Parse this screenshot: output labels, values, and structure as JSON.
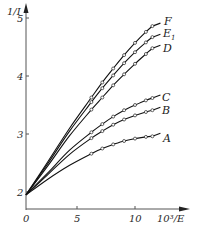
{
  "chart_data": {
    "type": "line",
    "title": "",
    "xlabel": "10³/E",
    "ylabel": "1/I",
    "xlim": [
      0,
      13.5
    ],
    "ylim": [
      1.73,
      5.2
    ],
    "x_ticks": [
      "0",
      "5",
      "10"
    ],
    "y_ticks": [
      "2",
      "3",
      "4",
      "5"
    ],
    "grid": false,
    "legend_position": "inline labels at right end of each curve",
    "series": [
      {
        "name": "A",
        "x": [
          0,
          2,
          4,
          6,
          7,
          8,
          9,
          10,
          11,
          11.6
        ],
        "values": [
          1.95,
          2.22,
          2.46,
          2.66,
          2.75,
          2.82,
          2.88,
          2.92,
          2.95,
          2.96
        ]
      },
      {
        "name": "B",
        "x": [
          0,
          2,
          4,
          6,
          7,
          8,
          9,
          10,
          11,
          11.6
        ],
        "values": [
          1.95,
          2.3,
          2.65,
          2.93,
          3.05,
          3.16,
          3.25,
          3.32,
          3.38,
          3.41
        ]
      },
      {
        "name": "C",
        "x": [
          0,
          2,
          4,
          6,
          7,
          8,
          9,
          10,
          11,
          11.6
        ],
        "values": [
          1.95,
          2.33,
          2.72,
          3.03,
          3.17,
          3.3,
          3.41,
          3.5,
          3.58,
          3.62
        ]
      },
      {
        "name": "D",
        "x": [
          0,
          2,
          4,
          6,
          7,
          8,
          9,
          10,
          11,
          11.6
        ],
        "values": [
          1.95,
          2.45,
          2.97,
          3.42,
          3.63,
          3.84,
          4.03,
          4.21,
          4.38,
          4.48
        ]
      },
      {
        "name": "E1",
        "x": [
          0,
          2,
          4,
          6,
          7,
          8,
          9,
          10,
          11,
          11.6
        ],
        "values": [
          1.95,
          2.49,
          3.05,
          3.55,
          3.79,
          4.01,
          4.22,
          4.41,
          4.58,
          4.67
        ]
      },
      {
        "name": "F",
        "x": [
          0,
          2,
          4,
          6,
          7,
          8,
          9,
          10,
          11,
          11.6
        ],
        "values": [
          1.95,
          2.52,
          3.1,
          3.63,
          3.89,
          4.13,
          4.36,
          4.57,
          4.76,
          4.86
        ]
      }
    ],
    "markers": "open circles on data points from x≈6.5 to x≈11.5"
  },
  "axes": {
    "y_label": "1/I",
    "x_label": "10³/E",
    "y_tick_labels": [
      "2",
      "3",
      "4",
      "5"
    ],
    "x_tick_labels": [
      "0",
      "5",
      "10"
    ]
  },
  "curve_labels": {
    "A": "A",
    "B": "B",
    "C": "C",
    "D": "D",
    "E1_main": "E",
    "E1_sub": "1",
    "F": "F"
  }
}
